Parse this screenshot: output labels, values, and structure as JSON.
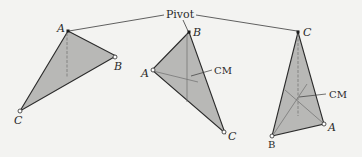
{
  "figure": {
    "pivot_label": "Pivot",
    "cm_label": "CM",
    "colors": {
      "background": "#f3f3f1",
      "triangle_fill": "#b8b8b6",
      "stroke": "#2b2b2b",
      "dashed": "#6e6e6e"
    },
    "triangles": [
      {
        "id": "triangle-1",
        "vertices": {
          "A": "A",
          "B": "B",
          "C": "C"
        },
        "pivot_vertex": "A"
      },
      {
        "id": "triangle-2",
        "vertices": {
          "A": "A",
          "B": "B",
          "C": "C"
        },
        "pivot_vertex": "B"
      },
      {
        "id": "triangle-3",
        "vertices": {
          "A": "A",
          "B": "B",
          "C": "C"
        },
        "pivot_vertex": "C"
      }
    ]
  }
}
